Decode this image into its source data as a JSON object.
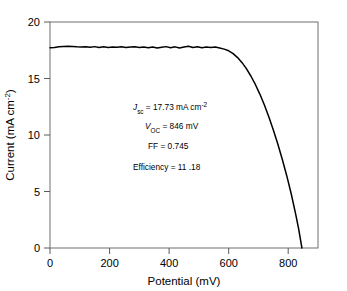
{
  "chart_data": {
    "type": "line",
    "title": "",
    "xlabel": "Potential (mV)",
    "ylabel": "Current (mA cm-2)",
    "ylabel_display": "Current (mA cm",
    "ylabel_sup": "-2",
    "ylabel_tail": ")",
    "xlim": [
      0,
      900
    ],
    "ylim": [
      0,
      20
    ],
    "xticks": [
      0,
      200,
      400,
      600,
      800
    ],
    "xtick_labels": [
      "0",
      "200",
      "400",
      "600",
      "800"
    ],
    "yticks": [
      0,
      5,
      10,
      15,
      20
    ],
    "ytick_labels": [
      "0",
      "5",
      "10",
      "15",
      "20"
    ],
    "grid": false,
    "legend": "none",
    "line_color": "#000000",
    "frame_color": "#6f6f6f",
    "background_color": "#ffffff",
    "series": [
      {
        "name": "J-V curve",
        "x": [
          0,
          15,
          30,
          45,
          60,
          75,
          90,
          105,
          120,
          135,
          150,
          165,
          180,
          195,
          210,
          225,
          240,
          255,
          270,
          285,
          300,
          315,
          330,
          345,
          360,
          375,
          390,
          405,
          420,
          435,
          450,
          465,
          480,
          495,
          510,
          525,
          540,
          555,
          570,
          585,
          600,
          615,
          630,
          645,
          660,
          675,
          690,
          705,
          720,
          735,
          750,
          765,
          780,
          795,
          810,
          825,
          835,
          846
        ],
        "y": [
          17.72,
          17.74,
          17.8,
          17.84,
          17.86,
          17.84,
          17.8,
          17.78,
          17.8,
          17.76,
          17.82,
          17.74,
          17.8,
          17.74,
          17.78,
          17.76,
          17.8,
          17.74,
          17.78,
          17.8,
          17.74,
          17.78,
          17.72,
          17.78,
          17.7,
          17.76,
          17.82,
          17.72,
          17.8,
          17.7,
          17.78,
          17.86,
          17.74,
          17.8,
          17.72,
          17.78,
          17.74,
          17.78,
          17.7,
          17.6,
          17.45,
          17.2,
          16.85,
          16.4,
          15.85,
          15.2,
          14.45,
          13.6,
          12.65,
          11.6,
          10.45,
          9.2,
          7.85,
          6.4,
          4.8,
          3.0,
          1.7,
          0.0
        ]
      }
    ],
    "annotations": [
      {
        "name": "jsc",
        "symbol": "J",
        "subscript": "sc",
        "equals": " = 17.73 mA cm",
        "superscript": "-2",
        "full_text": "Jsc = 17.73 mA cm-2"
      },
      {
        "name": "voc",
        "symbol": "V",
        "subscript": "OC",
        "equals": " = 846 mV",
        "superscript": "",
        "full_text": "VOC = 846 mV"
      },
      {
        "name": "ff",
        "symbol": "",
        "subscript": "",
        "equals": "FF = 0.745",
        "superscript": "",
        "full_text": "FF = 0.745"
      },
      {
        "name": "efficiency",
        "symbol": "",
        "subscript": "",
        "equals": "Efficiency = 11 .18",
        "superscript": "",
        "full_text": "Efficiency = 11 .18"
      }
    ]
  }
}
